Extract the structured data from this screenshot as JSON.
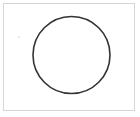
{
  "canvas": {
    "background": "#ffffff",
    "border_color": "#d6d6d6"
  },
  "shapes": [
    {
      "type": "circle",
      "cx": 71.5,
      "cy": 55,
      "r": 38.5,
      "stroke": "#333333",
      "stroke_width": 1.6,
      "fill": "none"
    },
    {
      "type": "dot",
      "cx": 19,
      "cy": 37,
      "r": 0.8,
      "fill": "#d0d0d0"
    }
  ]
}
